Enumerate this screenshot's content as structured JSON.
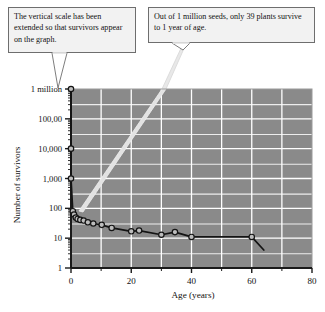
{
  "figure": {
    "title": "",
    "callouts": [
      {
        "id": "scale-note",
        "text": "The vertical scale has been extended so that survivors appear on the graph."
      },
      {
        "id": "survivors-note",
        "text": "Out of 1 million seeds, only 39 plants survive to 1 year of age."
      }
    ],
    "colors": {
      "plot_background": "#8a8a8a",
      "gridline": "#ffffff",
      "curve": "#141414",
      "marker_fill": "#bdbdbd",
      "marker_stroke": "#141414",
      "callout_fill": "#f2f2f2",
      "callout_border": "#6e6e6e",
      "leader_line": "#d9d9d9",
      "axis": "#1a1a1a"
    }
  },
  "chart_data": {
    "type": "line",
    "title": "",
    "subtitle": "",
    "xlabel": "Age (years)",
    "ylabel": "Number of survivors",
    "xlim": [
      0,
      80
    ],
    "ylim": [
      1,
      1000000
    ],
    "yscale": "log",
    "grid": true,
    "legend": null,
    "xticks": [
      0,
      20,
      40,
      60,
      80
    ],
    "xtick_labels": [
      "0",
      "20",
      "40",
      "60",
      "80"
    ],
    "yticks": [
      1,
      10,
      100,
      1000,
      10000,
      100000,
      1000000
    ],
    "ytick_labels": [
      "1",
      "10",
      "100",
      "1,000",
      "10,000",
      "100,00",
      "1 million"
    ],
    "series": [
      {
        "name": "Survivors",
        "x": [
          0,
          0,
          0,
          0.6,
          1,
          1.6,
          2.2,
          3.1,
          4.2,
          5.6,
          7.4,
          10.2,
          13.5,
          20,
          22.6,
          30,
          34.5,
          40,
          60,
          64
        ],
        "y": [
          1000000,
          10000,
          1000,
          80,
          62,
          49,
          44,
          41,
          39,
          34,
          31,
          28,
          22,
          17,
          18,
          13,
          16,
          11,
          11,
          4
        ],
        "markers": [
          true,
          true,
          true,
          true,
          true,
          true,
          true,
          true,
          true,
          true,
          true,
          true,
          true,
          true,
          true,
          true,
          true,
          true,
          true,
          false
        ]
      }
    ],
    "annotations": [
      {
        "text": "Out of 1 million seeds, only 39 plants survive to 1 year of age.",
        "points_to": {
          "x": 1,
          "y": 62
        }
      },
      {
        "text": "The vertical scale has been extended so that survivors appear on the graph.",
        "points_to": {
          "x": 0,
          "y": 1000000
        }
      }
    ]
  }
}
